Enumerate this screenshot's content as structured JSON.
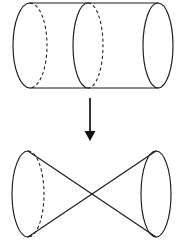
{
  "figure": {
    "background_color": "#ffffff",
    "stroke_color": "#1a1a1a",
    "arrow_color": "#111111",
    "top_shape": {
      "name": "cylinder",
      "label": "Cylinder with interior cross-section",
      "left_end": {
        "style": "half-solid-half-dashed",
        "cx": 30,
        "cy": 45.5,
        "rx": 17,
        "ry": 42.5
      },
      "mid_section": {
        "style": "half-solid-half-dashed",
        "cx": 88,
        "cy": 45.5,
        "rx": 15,
        "ry": 42.5
      },
      "right_end": {
        "style": "solid",
        "cx": 158,
        "cy": 45.5,
        "rx": 15,
        "ry": 42.5
      },
      "top_edge_y": 3,
      "bottom_edge_y": 88
    },
    "arrow": {
      "name": "downward-transformation-arrow",
      "direction": "down",
      "x": 90,
      "y_start": 98,
      "y_end": 141,
      "head_width": 11,
      "head_height": 9
    },
    "bottom_shape": {
      "name": "double-cone",
      "label": "Double cone (bowtie) formed by crossed rulings",
      "left_base": {
        "style": "half-solid-half-dashed",
        "cx": 28,
        "cy": 194,
        "rx": 16,
        "ry": 43
      },
      "right_base": {
        "style": "solid",
        "cx": 156,
        "cy": 194,
        "rx": 15,
        "ry": 43
      },
      "crossing_point": {
        "x": 90,
        "y": 195
      },
      "top_y": 151,
      "bottom_y": 237
    }
  },
  "caption": {
    "text": "",
    "visible": false,
    "note": "caption row clipped at image bottom edge"
  }
}
